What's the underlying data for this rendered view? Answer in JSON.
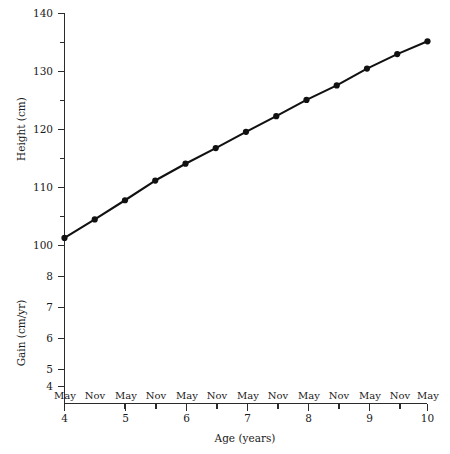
{
  "chart_data": {
    "type": "line",
    "title": "",
    "xlabel": "Age (years)",
    "ylabel": "Height (cm)",
    "ylabel_secondary": "Gain (cm/yr)",
    "xlim": [
      4,
      10
    ],
    "ylim": [
      100,
      140
    ],
    "ylim_secondary": [
      4,
      8
    ],
    "grid": false,
    "legend": "none",
    "x_major_ticks": [
      4,
      5,
      6,
      7,
      8,
      9,
      10
    ],
    "x_major_tick_labels": [
      "4",
      "5",
      "6",
      "7",
      "8",
      "9",
      "10"
    ],
    "x_minor_ticks": [
      4.5,
      5.5,
      6.5,
      7.5,
      8.5,
      9.5
    ],
    "season_ticks": [
      4.0,
      4.5,
      5.0,
      5.5,
      6.0,
      6.5,
      7.0,
      7.5,
      8.0,
      8.5,
      9.0,
      9.5,
      10.0
    ],
    "season_labels": [
      "May",
      "Nov",
      "May",
      "Nov",
      "May",
      "Nov",
      "May",
      "Nov",
      "May",
      "Nov",
      "May",
      "Nov",
      "May"
    ],
    "y_major_ticks": [
      100,
      110,
      120,
      130,
      140
    ],
    "y_major_tick_labels": [
      "100",
      "110",
      "120",
      "130",
      "140"
    ],
    "y_minor_ticks": [
      105,
      115,
      125,
      135
    ],
    "y_secondary_major_ticks": [
      4,
      5,
      6,
      7,
      8
    ],
    "y_secondary_tick_labels": [
      "4",
      "5",
      "6",
      "7",
      "8"
    ],
    "x": [
      4.0,
      4.5,
      5.0,
      5.5,
      6.0,
      6.5,
      7.0,
      7.5,
      8.0,
      8.5,
      9.0,
      9.5,
      10.0
    ],
    "series": [
      {
        "name": "Height",
        "values": [
          101.3,
          104.5,
          107.8,
          111.2,
          114.1,
          116.8,
          119.6,
          122.3,
          125.1,
          127.6,
          130.5,
          133.0,
          135.2
        ]
      }
    ],
    "marker": "filled-circle",
    "line_color": "#111111",
    "marker_color": "#111111",
    "axis_color": "#2b2b2b"
  }
}
